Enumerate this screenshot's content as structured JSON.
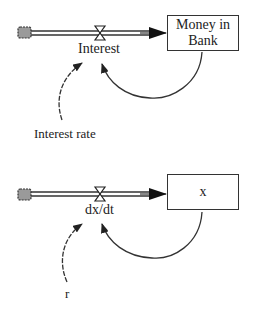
{
  "diagrams": [
    {
      "stock": {
        "label_line1": "Money in",
        "label_line2": "Bank"
      },
      "flow": {
        "label": "Interest"
      },
      "auxiliary": {
        "label": "Interest rate"
      }
    },
    {
      "stock": {
        "label_line1": "x",
        "label_line2": ""
      },
      "flow": {
        "label": "dx/dt"
      },
      "auxiliary": {
        "label": "r"
      }
    }
  ],
  "colors": {
    "line": "#333333",
    "cloud_fill": "#9a9a9a",
    "background": "#ffffff"
  }
}
